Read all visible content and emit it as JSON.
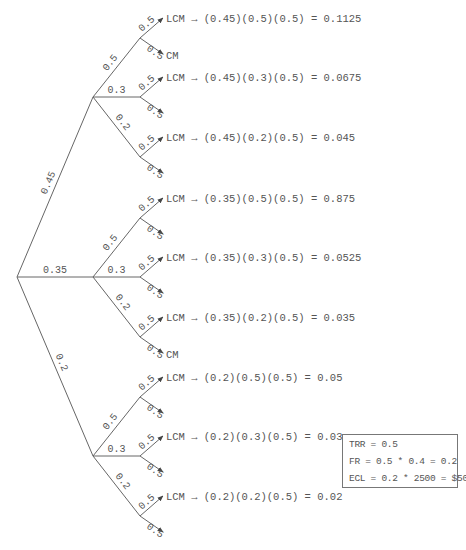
{
  "tree": {
    "level1": [
      {
        "prob": "0.45"
      },
      {
        "prob": "0.35"
      },
      {
        "prob": "0.2"
      }
    ],
    "level2_probs": [
      "0.5",
      "0.3",
      "0.2"
    ],
    "level3_probs": [
      "0.5",
      "0.5"
    ],
    "outcomes": [
      {
        "lcm": "LCM → (0.45)(0.5)(0.5) = 0.1125",
        "other": "CM"
      },
      {
        "lcm": "LCM → (0.45)(0.3)(0.5) = 0.0675",
        "other": ""
      },
      {
        "lcm": "LCM → (0.45)(0.2)(0.5) = 0.045",
        "other": ""
      },
      {
        "lcm": "LCM → (0.35)(0.5)(0.5) = 0.875",
        "other": ""
      },
      {
        "lcm": "LCM → (0.35)(0.3)(0.5) = 0.0525",
        "other": ""
      },
      {
        "lcm": "LCM → (0.35)(0.2)(0.5) = 0.035",
        "other": "CM"
      },
      {
        "lcm": "LCM → (0.2)(0.5)(0.5) = 0.05",
        "other": ""
      },
      {
        "lcm": "LCM → (0.2)(0.3)(0.5) = 0.03",
        "other": ""
      },
      {
        "lcm": "LCM → (0.2)(0.2)(0.5) = 0.02",
        "other": ""
      }
    ]
  },
  "summary": {
    "trr": "TRR = 0.5",
    "fr": "FR = 0.5 * 0.4 = 0.2",
    "ecl": "ECL = 0.2 * 2500 = $500"
  },
  "colors": {
    "line": "#666666",
    "text": "#555555"
  }
}
